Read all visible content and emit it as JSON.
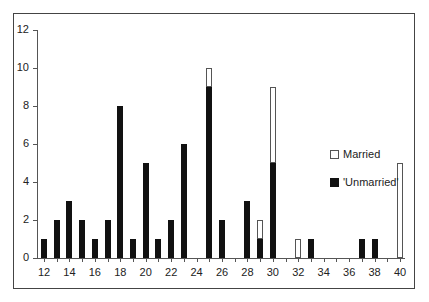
{
  "chart_data": {
    "type": "bar",
    "stacked": true,
    "title": "",
    "xlabel": "",
    "ylabel": "",
    "ylim": [
      0,
      12
    ],
    "yticks": [
      0,
      2,
      4,
      6,
      8,
      10,
      12
    ],
    "xlim": [
      12,
      40
    ],
    "xticks": [
      12,
      14,
      16,
      18,
      20,
      22,
      24,
      26,
      28,
      30,
      32,
      34,
      36,
      38,
      40
    ],
    "grid": false,
    "legend_position": "right",
    "categories": [
      12,
      13,
      14,
      15,
      16,
      17,
      18,
      19,
      20,
      21,
      22,
      23,
      24,
      25,
      26,
      27,
      28,
      29,
      30,
      31,
      32,
      33,
      34,
      35,
      36,
      37,
      38,
      39,
      40
    ],
    "series": [
      {
        "name": "'Unmarried'",
        "color": "#111111",
        "values": [
          1,
          2,
          3,
          2,
          1,
          2,
          8,
          1,
          5,
          1,
          2,
          6,
          0,
          9,
          2,
          0,
          3,
          1,
          5,
          0,
          0,
          1,
          0,
          0,
          0,
          1,
          1,
          0,
          0
        ]
      },
      {
        "name": "Married",
        "color": "#ffffff",
        "values": [
          0,
          0,
          0,
          0,
          0,
          0,
          0,
          0,
          0,
          0,
          0,
          0,
          0,
          1,
          0,
          0,
          0,
          1,
          4,
          0,
          1,
          0,
          0,
          0,
          0,
          0,
          0,
          0,
          5
        ]
      }
    ]
  },
  "legend": {
    "married": "Married",
    "unmarried": "'Unmarried'"
  }
}
